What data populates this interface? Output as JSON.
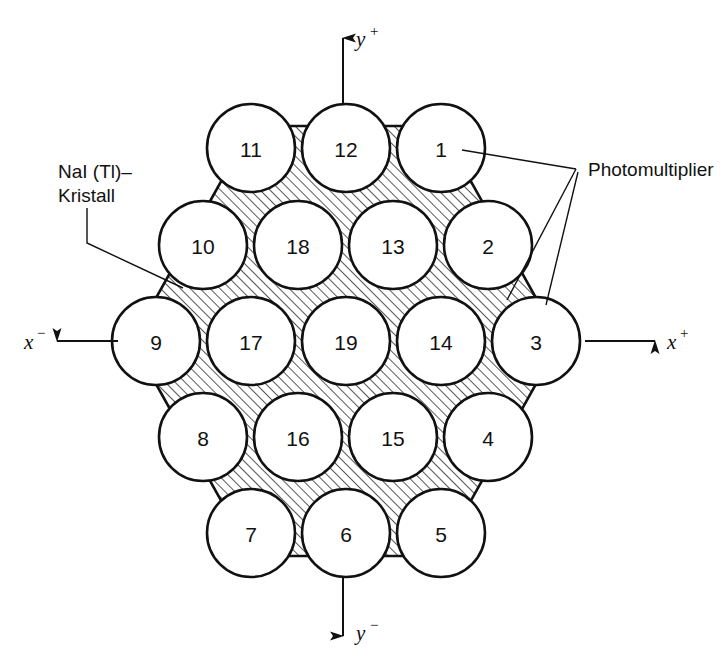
{
  "figure": {
    "type": "technical-diagram",
    "background_color": "#ffffff",
    "line_color": "#111111"
  },
  "labels": {
    "crystal": {
      "line1": "NaI (Tl)–",
      "line2": "Kristall"
    },
    "photomultiplier": "Photomultiplier"
  },
  "axes": {
    "y_pos": {
      "symbol": "y",
      "sign": "+"
    },
    "y_neg": {
      "symbol": "y",
      "sign": "−"
    },
    "x_pos": {
      "symbol": "x",
      "sign": "+"
    },
    "x_neg": {
      "symbol": "x",
      "sign": "−"
    }
  },
  "geometry": {
    "circle_radius": 44,
    "hatch_angle_deg": 45,
    "hatch_spacing": 7
  },
  "photomultipliers": [
    {
      "id": "11",
      "cx": 251,
      "cy": 148
    },
    {
      "id": "12",
      "cx": 346,
      "cy": 148
    },
    {
      "id": "1",
      "cx": 441,
      "cy": 148
    },
    {
      "id": "10",
      "cx": 203,
      "cy": 245
    },
    {
      "id": "18",
      "cx": 298,
      "cy": 245
    },
    {
      "id": "13",
      "cx": 393,
      "cy": 245
    },
    {
      "id": "2",
      "cx": 488,
      "cy": 245
    },
    {
      "id": "9",
      "cx": 156,
      "cy": 341
    },
    {
      "id": "17",
      "cx": 251,
      "cy": 341
    },
    {
      "id": "19",
      "cx": 346,
      "cy": 341
    },
    {
      "id": "14",
      "cx": 441,
      "cy": 341
    },
    {
      "id": "3",
      "cx": 536,
      "cy": 341
    },
    {
      "id": "8",
      "cx": 203,
      "cy": 437
    },
    {
      "id": "16",
      "cx": 298,
      "cy": 437
    },
    {
      "id": "15",
      "cx": 393,
      "cy": 437
    },
    {
      "id": "4",
      "cx": 488,
      "cy": 437
    },
    {
      "id": "7",
      "cx": 251,
      "cy": 533
    },
    {
      "id": "6",
      "cx": 346,
      "cy": 533
    },
    {
      "id": "5",
      "cx": 441,
      "cy": 533
    }
  ]
}
